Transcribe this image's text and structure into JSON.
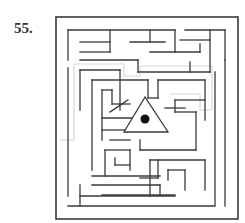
{
  "puzzle": {
    "number": "55."
  },
  "colors": {
    "wall": "#3a3a3a",
    "path": "#d8d8d8",
    "goal": "#111111"
  },
  "maze": {
    "border": {
      "x": 56,
      "y": 17,
      "w": 182,
      "h": 202
    },
    "walls": [
      [
        68,
        30,
        68,
        60
      ],
      [
        68,
        30,
        175,
        30
      ],
      [
        80,
        42,
        110,
        42
      ],
      [
        80,
        52,
        110,
        52
      ],
      [
        110,
        30,
        110,
        52
      ],
      [
        130,
        42,
        165,
        42
      ],
      [
        150,
        30,
        150,
        42
      ],
      [
        185,
        30,
        225,
        30
      ],
      [
        225,
        30,
        225,
        60
      ],
      [
        180,
        40,
        210,
        40
      ],
      [
        150,
        52,
        200,
        52
      ],
      [
        200,
        44,
        200,
        52
      ],
      [
        175,
        30,
        175,
        52
      ],
      [
        80,
        60,
        138,
        60
      ],
      [
        138,
        60,
        138,
        72
      ],
      [
        138,
        72,
        210,
        72
      ],
      [
        190,
        62,
        190,
        72
      ],
      [
        210,
        30,
        210,
        72
      ],
      [
        68,
        68,
        68,
        196
      ],
      [
        80,
        70,
        80,
        110
      ],
      [
        80,
        70,
        120,
        70
      ],
      [
        120,
        70,
        120,
        110
      ],
      [
        225,
        60,
        225,
        206
      ],
      [
        215,
        72,
        215,
        205
      ],
      [
        92,
        80,
        92,
        170
      ],
      [
        92,
        80,
        148,
        80
      ],
      [
        148,
        80,
        148,
        98
      ],
      [
        148,
        98,
        158,
        98
      ],
      [
        158,
        80,
        158,
        98
      ],
      [
        158,
        80,
        205,
        80
      ],
      [
        205,
        80,
        205,
        120
      ],
      [
        102,
        90,
        102,
        140
      ],
      [
        102,
        90,
        112,
        90
      ],
      [
        112,
        90,
        112,
        104
      ],
      [
        112,
        104,
        130,
        104
      ],
      [
        102,
        118,
        135,
        118
      ],
      [
        102,
        130,
        130,
        130
      ],
      [
        110,
        140,
        130,
        140
      ],
      [
        128,
        100,
        110,
        112
      ],
      [
        175,
        100,
        205,
        100
      ],
      [
        175,
        100,
        175,
        112
      ],
      [
        175,
        112,
        196,
        112
      ],
      [
        196,
        112,
        196,
        150
      ],
      [
        165,
        108,
        185,
        108
      ],
      [
        140,
        150,
        196,
        150
      ],
      [
        140,
        140,
        140,
        150
      ],
      [
        150,
        160,
        205,
        160
      ],
      [
        205,
        160,
        205,
        190
      ],
      [
        185,
        170,
        185,
        190
      ],
      [
        185,
        170,
        168,
        170
      ],
      [
        168,
        170,
        168,
        180
      ],
      [
        150,
        160,
        150,
        196
      ],
      [
        158,
        178,
        140,
        178
      ],
      [
        158,
        160,
        158,
        178
      ],
      [
        105,
        150,
        105,
        176
      ],
      [
        105,
        150,
        130,
        150
      ],
      [
        130,
        150,
        130,
        170
      ],
      [
        115,
        165,
        130,
        165
      ],
      [
        115,
        158,
        115,
        165
      ],
      [
        92,
        176,
        160,
        176
      ],
      [
        92,
        185,
        160,
        185
      ],
      [
        102,
        195,
        175,
        195
      ],
      [
        160,
        185,
        160,
        195
      ],
      [
        80,
        185,
        80,
        206
      ],
      [
        68,
        206,
        215,
        206
      ],
      [
        80,
        196,
        175,
        196
      ]
    ],
    "path": [
      [
        60,
        140
      ],
      [
        74,
        140
      ],
      [
        74,
        64
      ],
      [
        124,
        64
      ],
      [
        124,
        76
      ],
      [
        140,
        76
      ],
      [
        140,
        66
      ],
      [
        212,
        66
      ],
      [
        212,
        110
      ],
      [
        200,
        110
      ],
      [
        200,
        94
      ],
      [
        170,
        94
      ]
    ],
    "goal": {
      "x": 145,
      "y": 119,
      "r": 4.5,
      "triangle": [
        [
          145,
          97
        ],
        [
          124,
          132
        ],
        [
          168,
          132
        ]
      ]
    }
  }
}
